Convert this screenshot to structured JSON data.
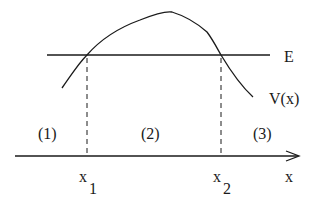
{
  "diagram": {
    "type": "potential-barrier",
    "energy_label": "E",
    "potential_label": "V(x)",
    "axis_label": "x",
    "regions": [
      "(1)",
      "(2)",
      "(3)"
    ],
    "turning_points": [
      {
        "base": "x",
        "sub": "1"
      },
      {
        "base": "x",
        "sub": "2"
      }
    ],
    "colors": {
      "stroke": "#1a1a1a",
      "background": "#ffffff"
    }
  }
}
